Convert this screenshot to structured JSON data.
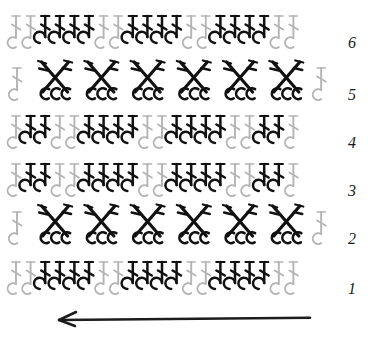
{
  "document": {
    "title": "Crochet Stitch Chart",
    "type": "crochet-pattern-diagram",
    "background_color": "#ffffff"
  },
  "colors": {
    "accent_dark": "#111111",
    "muted_light": "#b4b4b4",
    "muted_mid": "#8f8f8f",
    "row_number": "#1a1a1a",
    "arrow": "#1c1c1c"
  },
  "legend": {
    "symbol_names": [
      "chain-stitch",
      "double-crochet",
      "crossed-double-crochet"
    ]
  },
  "chart_data": {
    "type": "diagram",
    "direction_label": "work direction: right to left",
    "row_count": 6,
    "repeat_count": 3,
    "row_numbers": [
      "6",
      "5",
      "4",
      "3",
      "2",
      "1"
    ],
    "rows": [
      {
        "number": "6",
        "kind": "double-crochet-row",
        "y": 46,
        "groups": [
          {
            "type": "chain",
            "count": 2,
            "shade": "light"
          },
          {
            "type": "dc",
            "count": 4,
            "shade": "dark"
          },
          {
            "type": "chain",
            "count": 2,
            "shade": "light"
          },
          {
            "type": "dc",
            "count": 4,
            "shade": "dark"
          },
          {
            "type": "chain",
            "count": 2,
            "shade": "light"
          },
          {
            "type": "dc",
            "count": 4,
            "shade": "dark"
          },
          {
            "type": "chain",
            "count": 2,
            "shade": "light"
          }
        ]
      },
      {
        "number": "5",
        "kind": "crossed-stitch-row",
        "y": 98,
        "cross_count": 6,
        "edge_chains": 1
      },
      {
        "number": "4",
        "kind": "double-crochet-row",
        "y": 146,
        "groups": [
          {
            "type": "chain",
            "count": 1,
            "shade": "light"
          },
          {
            "type": "dc",
            "count": 2,
            "shade": "dark"
          },
          {
            "type": "chain",
            "count": 2,
            "shade": "light"
          },
          {
            "type": "dc",
            "count": 4,
            "shade": "dark"
          },
          {
            "type": "chain",
            "count": 2,
            "shade": "light"
          },
          {
            "type": "dc",
            "count": 4,
            "shade": "dark"
          },
          {
            "type": "chain",
            "count": 2,
            "shade": "light"
          },
          {
            "type": "dc",
            "count": 2,
            "shade": "dark"
          },
          {
            "type": "chain",
            "count": 1,
            "shade": "light"
          }
        ]
      },
      {
        "number": "3",
        "kind": "double-crochet-row",
        "y": 194,
        "groups": [
          {
            "type": "chain",
            "count": 1,
            "shade": "light"
          },
          {
            "type": "dc",
            "count": 2,
            "shade": "dark"
          },
          {
            "type": "chain",
            "count": 2,
            "shade": "light"
          },
          {
            "type": "dc",
            "count": 4,
            "shade": "dark"
          },
          {
            "type": "chain",
            "count": 2,
            "shade": "light"
          },
          {
            "type": "dc",
            "count": 4,
            "shade": "dark"
          },
          {
            "type": "chain",
            "count": 2,
            "shade": "light"
          },
          {
            "type": "dc",
            "count": 2,
            "shade": "dark"
          },
          {
            "type": "chain",
            "count": 1,
            "shade": "light"
          }
        ]
      },
      {
        "number": "2",
        "kind": "crossed-stitch-row",
        "y": 242,
        "cross_count": 6,
        "edge_chains": 1
      },
      {
        "number": "1",
        "kind": "double-crochet-row",
        "y": 292,
        "groups": [
          {
            "type": "chain",
            "count": 2,
            "shade": "light"
          },
          {
            "type": "dc",
            "count": 4,
            "shade": "dark"
          },
          {
            "type": "chain",
            "count": 2,
            "shade": "light"
          },
          {
            "type": "dc",
            "count": 4,
            "shade": "dark"
          },
          {
            "type": "chain",
            "count": 2,
            "shade": "light"
          },
          {
            "type": "dc",
            "count": 4,
            "shade": "dark"
          },
          {
            "type": "chain",
            "count": 2,
            "shade": "light"
          }
        ]
      }
    ],
    "arrow": {
      "name": "direction-arrow",
      "points": "left",
      "x_start": 310,
      "x_end": 59,
      "y": 320
    },
    "geometry": {
      "left_margin": 16,
      "right_margin": 333,
      "stitch_pitch": 14.6,
      "stitches_per_row": 22,
      "row_numbers_x": 352
    }
  }
}
